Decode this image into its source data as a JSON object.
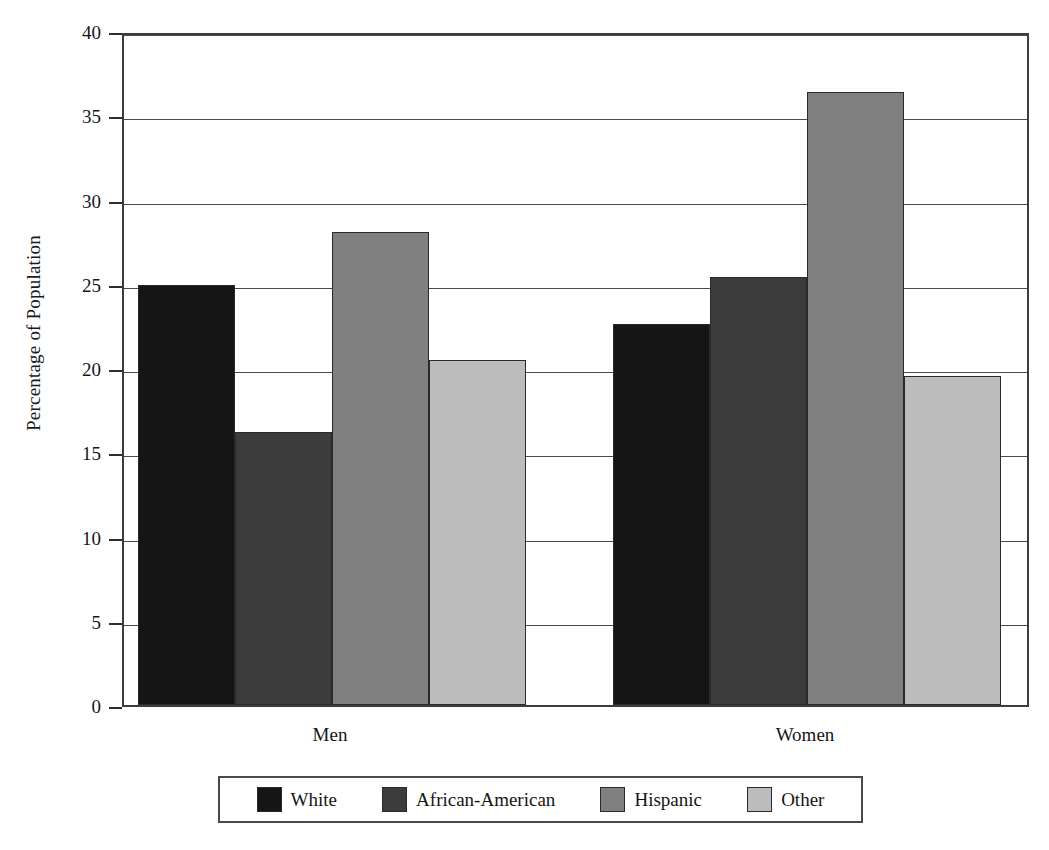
{
  "chart_data": {
    "type": "bar",
    "title": "",
    "xlabel": "",
    "ylabel": "Percentage of Population",
    "categories": [
      "Men",
      "Women"
    ],
    "ylim": [
      0,
      40
    ],
    "yticks": [
      0,
      5,
      10,
      15,
      20,
      25,
      30,
      35,
      40
    ],
    "ytick_labels": [
      "0",
      "5",
      "10",
      "15",
      "20",
      "25",
      "30",
      "35",
      "40"
    ],
    "grid": true,
    "legend_position": "bottom",
    "series": [
      {
        "name": "White",
        "color": "#151515",
        "values": [
          24.9,
          22.6
        ]
      },
      {
        "name": "African-American",
        "color": "#3c3c3c",
        "values": [
          16.2,
          25.4
        ]
      },
      {
        "name": "Hispanic",
        "color": "#808080",
        "values": [
          28.1,
          36.4
        ]
      },
      {
        "name": "Other",
        "color": "#bcbcbc",
        "values": [
          20.5,
          19.5
        ]
      }
    ]
  },
  "legend": {
    "items": [
      {
        "label": "White",
        "swatch": "legend-swatch-white"
      },
      {
        "label": "African-American",
        "swatch": "legend-swatch-african-american"
      },
      {
        "label": "Hispanic",
        "swatch": "legend-swatch-hispanic"
      },
      {
        "label": "Other",
        "swatch": "legend-swatch-other"
      }
    ]
  }
}
